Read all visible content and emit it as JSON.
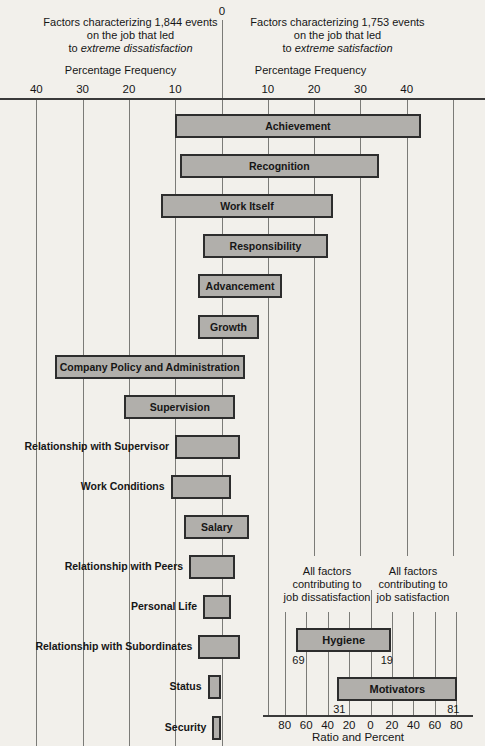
{
  "colors": {
    "background": "#f2f0eb",
    "bar_fill": "#b1afab",
    "bar_border": "#2d2d2d",
    "gridline": "#7b7b77",
    "axis": "#3a3a3a",
    "text": "#161616"
  },
  "header": {
    "zero_label": "0",
    "left_title": {
      "line1": "Factors characterizing 1,844 events",
      "line2": "on the job that led",
      "line3_prefix": "to ",
      "line3_italic": "extreme dissatisfaction"
    },
    "right_title": {
      "line1": "Factors characterizing 1,753 events",
      "line2": "on the job that led",
      "line3_prefix": "to ",
      "line3_italic": "extreme satisfaction"
    },
    "axis_label_left": "Percentage Frequency",
    "axis_label_right": "Percentage Frequency"
  },
  "chart_data": {
    "type": "bar",
    "layout": "horizontal-diverging",
    "title_left": "Factors characterizing 1,844 events on the job that led to extreme dissatisfaction",
    "title_right": "Factors characterizing 1,753 events on the job that led to extreme satisfaction",
    "xlabel_left": "Percentage Frequency",
    "xlabel_right": "Percentage Frequency",
    "x_unit": "percentage frequency",
    "x_tick_values": [
      -40,
      -30,
      -20,
      -10,
      0,
      10,
      20,
      30,
      40
    ],
    "extra_gridlines": [
      50
    ],
    "xlim": [
      -48,
      57
    ],
    "grid": true,
    "factors": [
      {
        "label": "Achievement",
        "dissatisfaction_pct": 10,
        "satisfaction_pct": 43,
        "label_inside": true
      },
      {
        "label": "Recognition",
        "dissatisfaction_pct": 9,
        "satisfaction_pct": 34,
        "label_inside": true
      },
      {
        "label": "Work Itself",
        "dissatisfaction_pct": 13,
        "satisfaction_pct": 24,
        "label_inside": true
      },
      {
        "label": "Responsibility",
        "dissatisfaction_pct": 4,
        "satisfaction_pct": 23,
        "label_inside": true
      },
      {
        "label": "Advancement",
        "dissatisfaction_pct": 5,
        "satisfaction_pct": 13,
        "label_inside": true
      },
      {
        "label": "Growth",
        "dissatisfaction_pct": 5,
        "satisfaction_pct": 8,
        "label_inside": true
      },
      {
        "label": "Company Policy and Administration",
        "dissatisfaction_pct": 36,
        "satisfaction_pct": 5,
        "label_inside": true
      },
      {
        "label": "Supervision",
        "dissatisfaction_pct": 21,
        "satisfaction_pct": 3,
        "label_inside": true
      },
      {
        "label": "Relationship with Supervisor",
        "dissatisfaction_pct": 10,
        "satisfaction_pct": 4,
        "label_inside": false
      },
      {
        "label": "Work Conditions",
        "dissatisfaction_pct": 11,
        "satisfaction_pct": 2,
        "label_inside": false
      },
      {
        "label": "Salary",
        "dissatisfaction_pct": 8,
        "satisfaction_pct": 6,
        "label_inside": true
      },
      {
        "label": "Relationship with Peers",
        "dissatisfaction_pct": 7,
        "satisfaction_pct": 3,
        "label_inside": false
      },
      {
        "label": "Personal Life",
        "dissatisfaction_pct": 4,
        "satisfaction_pct": 2,
        "label_inside": false
      },
      {
        "label": "Relationship with Subordinates",
        "dissatisfaction_pct": 5,
        "satisfaction_pct": 4,
        "label_inside": false
      },
      {
        "label": "Status",
        "dissatisfaction_pct": 3,
        "satisfaction_pct": 0,
        "label_inside": false
      },
      {
        "label": "Security",
        "dissatisfaction_pct": 2,
        "satisfaction_pct": 0,
        "label_inside": false
      }
    ],
    "inset": {
      "title_left": "All factors contributing to job dissatisfaction",
      "title_right": "All factors contributing to job satisfaction",
      "header_left": [
        "All factors",
        "contributing to",
        "job dissatisfaction"
      ],
      "header_right": [
        "All factors",
        "contributing to",
        "job satisfaction"
      ],
      "x_tick_values": [
        -80,
        -60,
        -40,
        -20,
        0,
        20,
        40,
        60,
        80
      ],
      "xlabel": "Ratio and Percent",
      "bars": [
        {
          "label": "Hygiene",
          "dissatisfaction_pct": 69,
          "satisfaction_pct": 19,
          "value_label_left": "69",
          "value_label_right": "19"
        },
        {
          "label": "Motivators",
          "dissatisfaction_pct": 31,
          "satisfaction_pct": 81,
          "value_label_left": "31",
          "value_label_right": "81"
        }
      ]
    }
  }
}
